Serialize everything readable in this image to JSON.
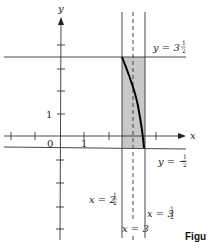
{
  "diagram": {
    "axes": {
      "x_label": "x",
      "y_label": "y",
      "origin_label": "0",
      "x_tick_label": "1",
      "y_tick_label": "1"
    },
    "lines": {
      "top": {
        "label_main": "y = 3",
        "label_frac_num": "1",
        "label_frac_den": "2"
      },
      "bottom": {
        "label_main": "y = −",
        "label_frac_num": "1",
        "label_frac_den": "2"
      },
      "left": {
        "label_main": "x = 2",
        "label_frac_num": "1",
        "label_frac_den": "2"
      },
      "middle": {
        "label_main": "x = 3"
      },
      "right": {
        "label_main": "x = 3",
        "label_frac_num": "1",
        "label_frac_den": "2"
      }
    },
    "colors": {
      "shade": "#c8c8c8",
      "line": "#333333",
      "curve": "#000000"
    },
    "caption": "Figu"
  }
}
